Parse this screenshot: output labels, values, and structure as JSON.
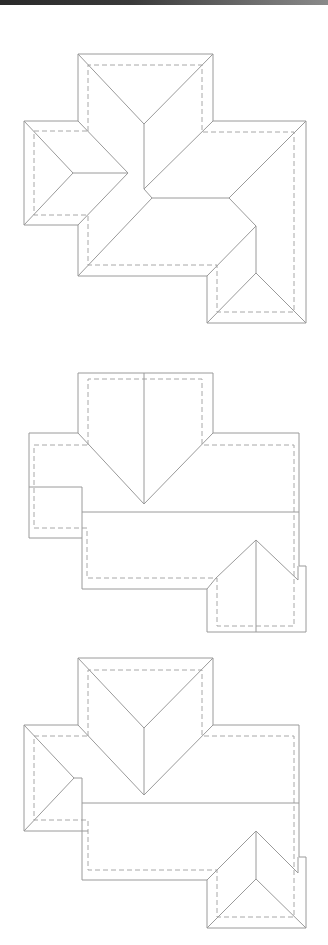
{
  "page": {
    "top_bar": {
      "label": ""
    }
  },
  "colors": {
    "background": "#ffffff",
    "line_solid": "#9a9a9a",
    "line_dashed": "#a8a8a8",
    "top_bar_dark": "#2a2a2a",
    "top_bar_light": "#8a8a8a"
  },
  "diagrams": [
    {
      "id": "roof-plan-1",
      "style": "hip roof, cross layout with central valleys"
    },
    {
      "id": "roof-plan-2",
      "style": "gable/ridge roof with front triangular dormer and side wing"
    },
    {
      "id": "roof-plan-3",
      "style": "hip ends with central ridge and side wings"
    }
  ]
}
